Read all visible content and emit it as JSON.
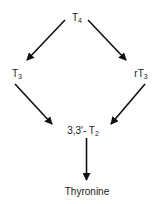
{
  "diagram": {
    "type": "metabolic-pathway",
    "nodes": [
      {
        "id": "t4",
        "base": "T",
        "sub": "4",
        "prefix": ""
      },
      {
        "id": "t3",
        "base": "T",
        "sub": "3",
        "prefix": ""
      },
      {
        "id": "rt3",
        "base": "T",
        "sub": "3",
        "prefix": "r"
      },
      {
        "id": "t2",
        "base": "T",
        "sub": "2",
        "prefix": "3,3′- "
      },
      {
        "id": "thyronine",
        "base": "Thyronine",
        "sub": "",
        "prefix": ""
      }
    ],
    "edges": [
      {
        "from": "T4",
        "to": "T3"
      },
      {
        "from": "T4",
        "to": "rT3"
      },
      {
        "from": "T3",
        "to": "3,3′-T2"
      },
      {
        "from": "rT3",
        "to": "3,3′-T2"
      },
      {
        "from": "3,3′-T2",
        "to": "Thyronine"
      }
    ],
    "colors": {
      "line": "#111111",
      "text": "#1a1a1a",
      "background": "#ffffff"
    }
  }
}
